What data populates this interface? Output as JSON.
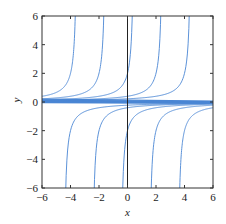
{
  "chart_data": {
    "type": "line",
    "title": "",
    "xlabel": "x",
    "ylabel": "y",
    "xlim": [
      -6,
      6
    ],
    "ylim": [
      -6,
      6
    ],
    "xticks": [
      -6,
      -4,
      -2,
      0,
      2,
      4,
      6
    ],
    "yticks": [
      -6,
      -4,
      -2,
      0,
      2,
      4,
      6
    ],
    "xtick_labels": [
      "−6",
      "−4",
      "−2",
      "0",
      "2",
      "4",
      "6"
    ],
    "ytick_labels": [
      "−6",
      "−4",
      "−2",
      "0",
      "2",
      "4",
      "6"
    ],
    "grid": false,
    "legend": null,
    "vertical_reference_line_x": 0,
    "upper_branch_asymptotes": [
      -3.5,
      -1.5,
      0.5,
      2.5,
      4.5
    ],
    "lower_branch_asymptotes": [
      -4.5,
      -2.5,
      -0.5,
      1.5,
      3.5
    ],
    "near_zero_lines": [
      {
        "y_at_xmin": 0.12,
        "y_at_xmax": 0.02
      },
      {
        "y_at_xmin": 0.08,
        "y_at_xmax": 0.0
      },
      {
        "y_at_xmin": 0.04,
        "y_at_xmax": -0.02
      },
      {
        "y_at_xmin": 0.0,
        "y_at_xmax": -0.05
      },
      {
        "y_at_xmin": 0.2,
        "y_at_xmax": 0.06
      },
      {
        "y_at_xmin": -0.03,
        "y_at_xmax": -0.09
      }
    ],
    "series_color": "#4a86d4",
    "axis_color": "#333333"
  }
}
